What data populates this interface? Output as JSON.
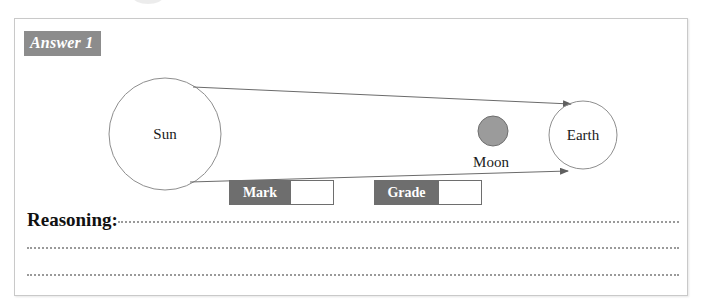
{
  "page": {
    "background_color": "#ffffff",
    "panel_border_color": "#c9c9c9"
  },
  "answer_panel": {
    "badge_label": "Answer 1",
    "badge_bg_color": "#8c8c8c",
    "badge_text_color": "#ffffff"
  },
  "diagram": {
    "type": "eclipse-ray-diagram",
    "bodies": [
      {
        "name": "sun",
        "label": "Sun",
        "shape": "circle",
        "cx": 150,
        "cy": 115,
        "r": 56,
        "fill": "none",
        "stroke": "#8e8e8e"
      },
      {
        "name": "moon",
        "label": "Moon",
        "shape": "circle",
        "cx": 478,
        "cy": 112,
        "r": 15,
        "fill": "#9b9b9b",
        "stroke": "#6e6e6e"
      },
      {
        "name": "earth",
        "label": "Earth",
        "shape": "circle",
        "cx": 568,
        "cy": 116,
        "r": 34,
        "fill": "none",
        "stroke": "#8e8e8e"
      }
    ],
    "rays": [
      {
        "name": "ray-upper",
        "from_x": 178,
        "from_y": 68,
        "to_x": 556,
        "to_y": 85,
        "crosses": true,
        "arrow": "end"
      },
      {
        "name": "ray-lower",
        "from_x": 175,
        "from_y": 163,
        "to_x": 553,
        "to_y": 152,
        "crosses": true,
        "arrow": "end"
      }
    ],
    "crossing_point": {
      "x": 398,
      "y": 116
    },
    "labels": {
      "sun_label_x": 150,
      "sun_label_y": 120,
      "moon_label_x": 476,
      "moon_label_y": 148,
      "earth_label_x": 568,
      "earth_label_y": 121
    },
    "line_color": "#6b6b6b"
  },
  "marking": {
    "mark": {
      "label": "Mark",
      "value": ""
    },
    "grade": {
      "label": "Grade",
      "value": ""
    },
    "label_bg_color": "#6e6e6e",
    "label_text_color": "#ffffff"
  },
  "reasoning": {
    "label": "Reasoning:",
    "value": "",
    "blank_line_count": 2
  }
}
